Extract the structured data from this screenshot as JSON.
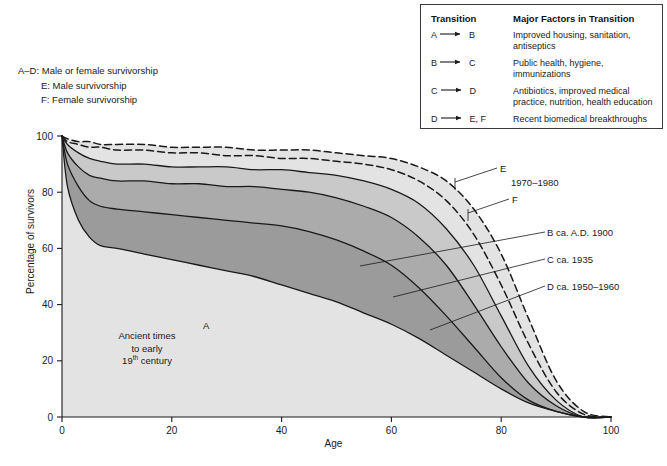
{
  "figure": {
    "key_lines": [
      "A–D: Male or female survivorship",
      "E: Male survivorship",
      "F: Female survivorship"
    ],
    "notes": {
      "ancient_l1": "Ancient times",
      "ancient_l2": "to early",
      "ancient_l3_num": "19",
      "ancient_l3_sup": "th",
      "ancient_l3_rest": " century"
    }
  },
  "legend": {
    "header_transition": "Transition",
    "header_factors": "Major Factors in Transition",
    "rows": [
      {
        "from": "A",
        "to": "B",
        "factors": "Improved housing, sanitation, antiseptics"
      },
      {
        "from": "B",
        "to": "C",
        "factors": "Public health, hygiene, immunizations"
      },
      {
        "from": "C",
        "to": "D",
        "factors": "Antibiotics, improved medical practice, nutrition, health education"
      },
      {
        "from": "D",
        "to": "E, F",
        "factors": "Recent biomedical breakthroughs"
      }
    ]
  },
  "curve_labels": {
    "A": "A",
    "E": "E",
    "E_years": "1970–1980",
    "F": "F",
    "B": "B ca. A.D. 1900",
    "C": "C ca. 1935",
    "D": "D ca. 1950–1960"
  },
  "chart_data": {
    "type": "line",
    "title": "",
    "xlabel": "Age",
    "ylabel": "Percentage of survivors",
    "xlim": [
      0,
      100
    ],
    "ylim": [
      0,
      100
    ],
    "xticks": [
      0,
      20,
      40,
      60,
      80,
      100
    ],
    "yticks": [
      0,
      20,
      40,
      60,
      80,
      100
    ],
    "grid": false,
    "legend_position": "inside-right",
    "colors": {
      "curve_line": "#1a1a1a",
      "band_A": "#e3e3e3",
      "band_B": "#c9c9c9",
      "band_C": "#ababab",
      "band_D": "#9b9b9b",
      "legend_border": "#3a3a3a",
      "background": "#ffffff"
    },
    "x": [
      0,
      1,
      3,
      5,
      7,
      10,
      15,
      20,
      25,
      30,
      35,
      40,
      45,
      50,
      55,
      60,
      65,
      70,
      75,
      80,
      85,
      90,
      95,
      100
    ],
    "series": [
      {
        "name": "A",
        "label": "A",
        "style": "solid",
        "description": "Ancient times to early 19th century",
        "values": [
          100,
          82,
          70,
          64,
          61,
          60,
          58,
          56,
          54,
          52,
          50,
          47,
          44,
          41,
          37,
          33,
          28,
          22,
          16,
          10,
          5,
          2,
          0,
          0
        ]
      },
      {
        "name": "B",
        "label": "B ca. A.D. 1900",
        "style": "solid",
        "description": "ca. A.D. 1900",
        "values": [
          100,
          90,
          82,
          77,
          75,
          74,
          73,
          72,
          71,
          70,
          69,
          68,
          66,
          63,
          59,
          54,
          46,
          36,
          25,
          14,
          6,
          2,
          0,
          0
        ]
      },
      {
        "name": "C",
        "label": "C ca. 1935",
        "style": "solid",
        "description": "ca. 1935",
        "values": [
          100,
          94,
          89,
          86,
          85,
          84,
          84,
          83,
          83,
          82,
          82,
          81,
          80,
          78,
          75,
          71,
          64,
          54,
          40,
          25,
          12,
          4,
          0,
          0
        ]
      },
      {
        "name": "D",
        "label": "D ca. 1950–1960",
        "style": "solid",
        "description": "ca. 1950–1960",
        "values": [
          100,
          97,
          94,
          92,
          91,
          90,
          90,
          89,
          89,
          89,
          88,
          88,
          87,
          86,
          84,
          81,
          76,
          67,
          54,
          36,
          18,
          6,
          0,
          0
        ]
      },
      {
        "name": "E",
        "label": "E",
        "style": "dashed",
        "description": "Male survivorship 1970–1980",
        "values": [
          100,
          98,
          97,
          96,
          96,
          95,
          95,
          94,
          94,
          93,
          93,
          92,
          92,
          91,
          90,
          88,
          84,
          77,
          65,
          47,
          26,
          9,
          1,
          0
        ]
      },
      {
        "name": "F",
        "label": "F",
        "style": "dashed",
        "description": "Female survivorship 1970–1980",
        "values": [
          100,
          99,
          98,
          98,
          97,
          97,
          97,
          96,
          96,
          96,
          95,
          95,
          95,
          94,
          93,
          92,
          89,
          84,
          74,
          58,
          35,
          13,
          2,
          0
        ]
      }
    ]
  }
}
